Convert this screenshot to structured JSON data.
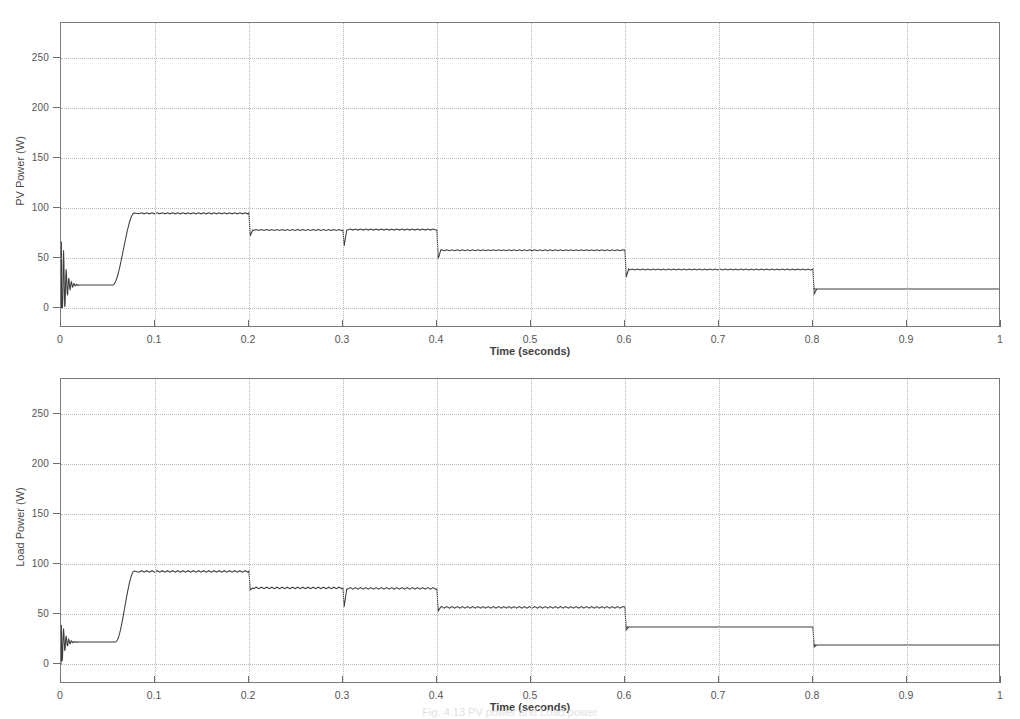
{
  "figure": {
    "caption": "Fig. 4.13   PV power and Load power",
    "background_color": "#ffffff",
    "trace_color": "#3d3d3d",
    "grid_color": "#b9b9b9",
    "axis_color": "#7a7a7a"
  },
  "panels": [
    {
      "id": "pv-power",
      "ylabel": "PV Power (W)",
      "xlabel": "Time (seconds)",
      "ytick_labels": [
        "0",
        "50",
        "100",
        "150",
        "200",
        "250"
      ],
      "xtick_labels": [
        "0",
        "0.1",
        "0.2",
        "0.3",
        "0.4",
        "0.5",
        "0.6",
        "0.7",
        "0.8",
        "0.9",
        "1"
      ]
    },
    {
      "id": "load-power",
      "ylabel": "Load Power (W)",
      "xlabel": "Time (seconds)",
      "ytick_labels": [
        "0",
        "50",
        "100",
        "150",
        "200",
        "250"
      ],
      "xtick_labels": [
        "0",
        "0.1",
        "0.2",
        "0.3",
        "0.4",
        "0.5",
        "0.6",
        "0.7",
        "0.8",
        "0.9",
        "1"
      ]
    }
  ],
  "chart_data": [
    {
      "type": "line",
      "id": "pv-power",
      "title": "",
      "xlabel": "Time (seconds)",
      "ylabel": "PV Power (W)",
      "xlim": [
        0,
        1
      ],
      "ylim": [
        -20,
        285
      ],
      "yticks": [
        0,
        50,
        100,
        150,
        200,
        250
      ],
      "xticks": [
        0,
        0.1,
        0.2,
        0.3,
        0.4,
        0.5,
        0.6,
        0.7,
        0.8,
        0.9,
        1.0
      ],
      "grid": true,
      "legend": "none",
      "series": [
        {
          "name": "PV Power",
          "ripple_amplitude": 2.0,
          "ripple_period": 0.0055,
          "startup_transient": {
            "range": [
              0.0,
              0.018
            ],
            "peak": 100,
            "trough": 0,
            "description": "damped oscillation from 0 to ~100 W settling to 23 W"
          },
          "segments": [
            {
              "t_start": 0.0,
              "t_end": 0.055,
              "value": 23,
              "ripple": false
            },
            {
              "t_start": 0.055,
              "t_end": 0.078,
              "value": null,
              "ramp_from": 23,
              "ramp_to": 95,
              "ripple": false
            },
            {
              "t_start": 0.078,
              "t_end": 0.2,
              "value": 95,
              "ripple": true
            },
            {
              "t_start": 0.2,
              "t_end": 0.3,
              "value": 78,
              "ripple": true,
              "step_undershoot": 72
            },
            {
              "t_start": 0.3,
              "t_end": 0.4,
              "value": 78,
              "ripple": true,
              "step_undershoot": 62
            },
            {
              "t_start": 0.4,
              "t_end": 0.6,
              "value": 58,
              "ripple": true,
              "step_undershoot": 49
            },
            {
              "t_start": 0.6,
              "t_end": 0.8,
              "value": 39,
              "ripple": true,
              "step_undershoot": 31
            },
            {
              "t_start": 0.8,
              "t_end": 1.0,
              "value": 19,
              "ripple": false,
              "step_undershoot": 14
            }
          ]
        }
      ]
    },
    {
      "type": "line",
      "id": "load-power",
      "title": "",
      "xlabel": "Time (seconds)",
      "ylabel": "Load Power (W)",
      "xlim": [
        0,
        1
      ],
      "ylim": [
        -20,
        285
      ],
      "yticks": [
        0,
        50,
        100,
        150,
        200,
        250
      ],
      "xticks": [
        0,
        0.1,
        0.2,
        0.3,
        0.4,
        0.5,
        0.6,
        0.7,
        0.8,
        0.9,
        1.0
      ],
      "grid": true,
      "legend": "none",
      "series": [
        {
          "name": "Load Power",
          "ripple_amplitude": 3.0,
          "ripple_period": 0.0055,
          "startup_transient": {
            "range": [
              0.0,
              0.018
            ],
            "peak": 52,
            "trough": 0,
            "description": "short damped oscillation from 0 to ~52 W settling to 22 W"
          },
          "segments": [
            {
              "t_start": 0.0,
              "t_end": 0.058,
              "value": 22,
              "ripple": false
            },
            {
              "t_start": 0.058,
              "t_end": 0.078,
              "value": null,
              "ramp_from": 22,
              "ramp_to": 93,
              "ripple": false
            },
            {
              "t_start": 0.078,
              "t_end": 0.2,
              "value": 93,
              "ripple": true
            },
            {
              "t_start": 0.2,
              "t_end": 0.3,
              "value": 76,
              "ripple": true,
              "step_undershoot": 74
            },
            {
              "t_start": 0.3,
              "t_end": 0.4,
              "value": 75,
              "ripple": true,
              "step_undershoot": 57
            },
            {
              "t_start": 0.4,
              "t_end": 0.6,
              "value": 57,
              "ripple": true,
              "step_undershoot": 53
            },
            {
              "t_start": 0.6,
              "t_end": 0.8,
              "value": 37,
              "ripple": false,
              "step_undershoot": 34
            },
            {
              "t_start": 0.8,
              "t_end": 1.0,
              "value": 19,
              "ripple": false,
              "step_undershoot": 17
            }
          ]
        }
      ]
    }
  ]
}
